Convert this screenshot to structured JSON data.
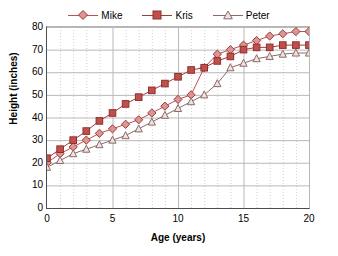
{
  "chart_data": {
    "type": "line",
    "title": "",
    "xlabel": "Age (years)",
    "ylabel": "Height (inches)",
    "xlim": [
      0,
      20
    ],
    "ylim": [
      0,
      80
    ],
    "xticks": [
      0,
      5,
      10,
      15,
      20
    ],
    "yticks": [
      0,
      10,
      20,
      30,
      40,
      50,
      60,
      70,
      80
    ],
    "xtick_labels": [
      "0",
      "5",
      "10",
      "15",
      "20"
    ],
    "ytick_labels": [
      "0",
      "10",
      "20",
      "30",
      "40",
      "50",
      "60",
      "70",
      "80"
    ],
    "x_minor_step": 1,
    "grid": {
      "horizontal_major": true,
      "vertical_major": true,
      "vertical_minor_dotted": true
    },
    "legend_position": "top-center",
    "x": [
      0,
      1,
      2,
      3,
      4,
      5,
      6,
      7,
      8,
      9,
      10,
      11,
      12,
      13,
      14,
      15,
      16,
      17,
      18,
      19,
      20
    ],
    "series": [
      {
        "name": "Mike",
        "marker": "diamond",
        "color": "#c0504d",
        "fill": "#d99694",
        "values": [
          20,
          24,
          27,
          30,
          33,
          35,
          37,
          39,
          42,
          45,
          48,
          50,
          62,
          68,
          70,
          72,
          74,
          76,
          77,
          78,
          78
        ]
      },
      {
        "name": "Kris",
        "marker": "square",
        "color": "#a33a37",
        "fill": "#c0504d",
        "values": [
          22,
          26,
          30,
          34,
          38.5,
          42,
          46,
          49,
          52,
          55,
          58,
          61,
          62,
          65,
          67,
          70,
          71,
          71,
          72,
          72,
          72
        ]
      },
      {
        "name": "Peter",
        "marker": "triangle",
        "color": "#5a5a5a",
        "fill": "#e8d6d4",
        "values": [
          18,
          21,
          24,
          26,
          28,
          30,
          32,
          35,
          38,
          41,
          44,
          47,
          50,
          55,
          62,
          64,
          66,
          67,
          68,
          68.5,
          68.5
        ]
      }
    ]
  },
  "legend": {
    "entries": [
      {
        "label": "Mike"
      },
      {
        "label": "Kris"
      },
      {
        "label": "Peter"
      }
    ]
  },
  "axes": {
    "x_title": "Age (years)",
    "y_title": "Height (inches)"
  }
}
